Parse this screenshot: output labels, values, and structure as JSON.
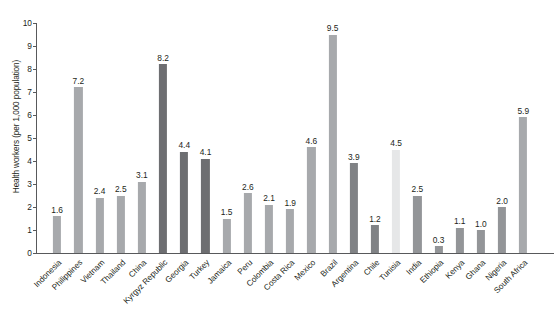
{
  "chart_data": {
    "type": "bar",
    "title": "",
    "xlabel": "",
    "ylabel": "Health workers (per 1,000 population)",
    "ylim": [
      0,
      10
    ],
    "ytick_labels": [
      "10",
      "9",
      "8",
      "7",
      "6",
      "5",
      "4",
      "3",
      "2",
      "1",
      "0"
    ],
    "ytick_values": [
      10,
      9,
      8,
      7,
      6,
      5,
      4,
      3,
      2,
      1,
      0
    ],
    "grid": false,
    "legend": "none",
    "categories": [
      "Indonesia",
      "Philippines",
      "Vietnam",
      "Thailand",
      "China",
      "Kyrgyz Republic",
      "Georgia",
      "Turkey",
      "Jamaica",
      "Peru",
      "Colombia",
      "Costa Rica",
      "Mexico",
      "Brazil",
      "Argentina",
      "Chile",
      "Tunisia",
      "India",
      "Ethiopia",
      "Kenya",
      "Ghana",
      "Nigeria",
      "South Africa"
    ],
    "values": [
      1.6,
      7.2,
      2.4,
      2.5,
      3.1,
      8.2,
      4.4,
      4.1,
      1.5,
      2.6,
      2.1,
      1.9,
      4.6,
      9.5,
      3.9,
      1.2,
      4.5,
      2.5,
      0.3,
      1.1,
      1.0,
      2.0,
      5.9
    ],
    "value_labels": [
      "1.6",
      "7.2",
      "2.4",
      "2.5",
      "3.1",
      "8.2",
      "4.4",
      "4.1",
      "1.5",
      "2.6",
      "2.1",
      "1.9",
      "4.6",
      "9.5",
      "3.9",
      "1.2",
      "4.5",
      "2.5",
      "0.3",
      "1.1",
      "1.0",
      "2.0",
      "5.9"
    ],
    "bar_colors": [
      "#a7a9ac",
      "#a7a9ac",
      "#a7a9ac",
      "#a7a9ac",
      "#a7a9ac",
      "#6d6e71",
      "#6d6e71",
      "#6d6e71",
      "#a7a9ac",
      "#a7a9ac",
      "#a7a9ac",
      "#a7a9ac",
      "#a7a9ac",
      "#a7a9ac",
      "#808285",
      "#808285",
      "#e6e7e8",
      "#939598",
      "#939598",
      "#939598",
      "#939598",
      "#939598",
      "#a7a9ac"
    ]
  },
  "colors": {
    "axis": "#58595b",
    "text": "#231f20",
    "background": "#ffffff",
    "bar_light": "#a7a9ac",
    "bar_dark": "#6d6e71",
    "bar_pale": "#e6e7e8",
    "bar_medium": "#939598"
  }
}
